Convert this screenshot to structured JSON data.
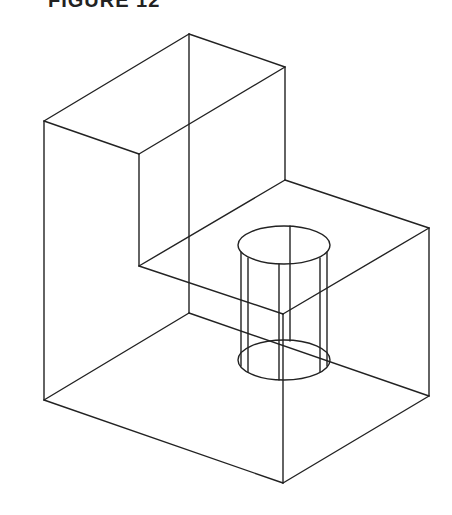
{
  "figure": {
    "title": "FIGURE 12",
    "stroke_color": "#222222",
    "background": "#ffffff"
  },
  "drawing": {
    "type": "isometric-wireframe",
    "subject": "L-shaped block with cylindrical boss",
    "edges": [
      {
        "x1": 189,
        "y1": 34,
        "x2": 44,
        "y2": 121
      },
      {
        "x1": 189,
        "y1": 34,
        "x2": 285,
        "y2": 67
      },
      {
        "x1": 44,
        "y1": 121,
        "x2": 139,
        "y2": 154
      },
      {
        "x1": 285,
        "y1": 67,
        "x2": 139,
        "y2": 154
      },
      {
        "x1": 189,
        "y1": 34,
        "x2": 189,
        "y2": 313
      },
      {
        "x1": 285,
        "y1": 67,
        "x2": 285,
        "y2": 180
      },
      {
        "x1": 139,
        "y1": 154,
        "x2": 139,
        "y2": 266
      },
      {
        "x1": 139,
        "y1": 266,
        "x2": 285,
        "y2": 180
      },
      {
        "x1": 285,
        "y1": 180,
        "x2": 429,
        "y2": 228
      },
      {
        "x1": 139,
        "y1": 266,
        "x2": 283,
        "y2": 314
      },
      {
        "x1": 283,
        "y1": 314,
        "x2": 429,
        "y2": 228
      },
      {
        "x1": 44,
        "y1": 121,
        "x2": 44,
        "y2": 400
      },
      {
        "x1": 44,
        "y1": 400,
        "x2": 189,
        "y2": 313
      },
      {
        "x1": 189,
        "y1": 313,
        "x2": 429,
        "y2": 396
      },
      {
        "x1": 44,
        "y1": 400,
        "x2": 283,
        "y2": 483
      },
      {
        "x1": 283,
        "y1": 483,
        "x2": 429,
        "y2": 396
      },
      {
        "x1": 283,
        "y1": 314,
        "x2": 283,
        "y2": 483
      },
      {
        "x1": 429,
        "y1": 228,
        "x2": 429,
        "y2": 396
      }
    ],
    "cylinder": {
      "top_ellipse": {
        "cx": 284,
        "cy": 245,
        "rx": 46,
        "ry": 19
      },
      "bottom_ellipse": {
        "cx": 284,
        "cy": 360,
        "rx": 46,
        "ry": 20
      },
      "verticals": [
        {
          "x": 241,
          "y1": 252,
          "y2": 366
        },
        {
          "x": 248,
          "y1": 258,
          "y2": 372
        },
        {
          "x": 279,
          "y1": 264,
          "y2": 380
        },
        {
          "x": 290,
          "y1": 226,
          "y2": 341
        },
        {
          "x": 320,
          "y1": 258,
          "y2": 372
        },
        {
          "x": 327,
          "y1": 252,
          "y2": 366
        }
      ]
    }
  }
}
